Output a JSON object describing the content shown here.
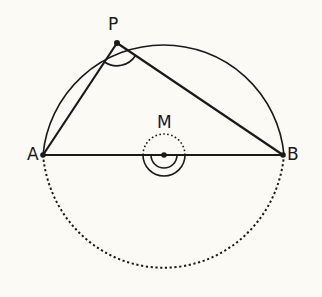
{
  "diagram": {
    "type": "inscribed angle (Thales) construction",
    "colors": {
      "background": "#fbfaf4",
      "stroke": "#1a1a1a"
    },
    "points": {
      "A": {
        "label": "A",
        "x": 43,
        "y": 155
      },
      "B": {
        "label": "B",
        "x": 283,
        "y": 155
      },
      "P": {
        "label": "P",
        "x": 117,
        "y": 43
      },
      "M": {
        "label": "M",
        "x": 164,
        "y": 155
      }
    },
    "circle": {
      "center": "M",
      "radius": 120,
      "upper_arc": "solid",
      "lower_arc": "dotted"
    },
    "segments": [
      "AB",
      "AP",
      "PB"
    ],
    "angle_marks": [
      {
        "at": "P",
        "style": "single arc"
      },
      {
        "at": "M",
        "style": "double arc (reflex, lower)",
        "upper_part": "dotted"
      }
    ]
  }
}
